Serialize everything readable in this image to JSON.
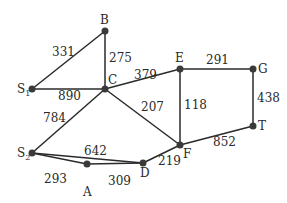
{
  "graph": {
    "nodes": [
      {
        "id": "B",
        "label": "B",
        "x": 105,
        "y": 31
      },
      {
        "id": "C",
        "label": "C",
        "x": 105,
        "y": 89
      },
      {
        "id": "S1",
        "label": "S",
        "sub": "1",
        "x": 32,
        "y": 89
      },
      {
        "id": "E",
        "label": "E",
        "x": 180,
        "y": 69
      },
      {
        "id": "G",
        "label": "G",
        "x": 253,
        "y": 69
      },
      {
        "id": "T",
        "label": "T",
        "x": 253,
        "y": 126
      },
      {
        "id": "F",
        "label": "F",
        "x": 180,
        "y": 145
      },
      {
        "id": "S2",
        "label": "S",
        "sub": "2",
        "x": 32,
        "y": 153
      },
      {
        "id": "A",
        "label": "A",
        "x": 87,
        "y": 164
      },
      {
        "id": "D",
        "label": "D",
        "x": 143,
        "y": 163
      }
    ],
    "edges": [
      {
        "from": "S1",
        "to": "B",
        "weight": "331"
      },
      {
        "from": "B",
        "to": "C",
        "weight": "275"
      },
      {
        "from": "S1",
        "to": "C",
        "weight": "890"
      },
      {
        "from": "C",
        "to": "E",
        "weight": "379"
      },
      {
        "from": "E",
        "to": "G",
        "weight": "291"
      },
      {
        "from": "G",
        "to": "T",
        "weight": "438"
      },
      {
        "from": "C",
        "to": "F",
        "weight": "207"
      },
      {
        "from": "E",
        "to": "F",
        "weight": "118"
      },
      {
        "from": "F",
        "to": "T",
        "weight": "852"
      },
      {
        "from": "C",
        "to": "S2",
        "weight": "784"
      },
      {
        "from": "S2",
        "to": "D",
        "weight": "642"
      },
      {
        "from": "S2",
        "to": "A",
        "weight": "293"
      },
      {
        "from": "A",
        "to": "D",
        "weight": "309"
      },
      {
        "from": "D",
        "to": "F",
        "weight": "219"
      }
    ]
  }
}
